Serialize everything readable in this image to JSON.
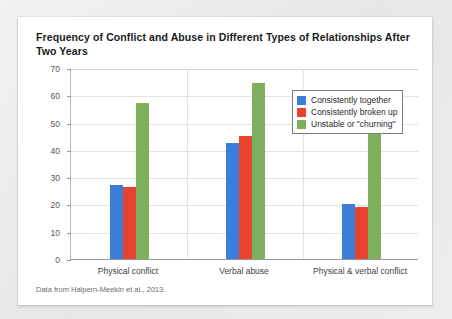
{
  "figure": {
    "title": "Frequency of Conflict and Abuse in Different Types of Relationships After Two Years",
    "caption": "Data from Halpern-Meekin et al., 2013."
  },
  "chart_data": {
    "type": "bar",
    "title": "Frequency of Conflict and Abuse in Different Types of Relationships After Two Years",
    "xlabel": "",
    "ylabel": "",
    "ylim": [
      0,
      70
    ],
    "yticks": [
      0,
      10,
      20,
      30,
      40,
      50,
      60,
      70
    ],
    "grid": true,
    "legend_position": "top-right",
    "categories": [
      "Physical conflict",
      "Verbal abuse",
      "Physical & verbal conflict"
    ],
    "series": [
      {
        "name": "Consistently together",
        "color": "#3b7dd8",
        "values": [
          27,
          42.5,
          20
        ]
      },
      {
        "name": "Consistently broken up",
        "color": "#e8432e",
        "values": [
          26.5,
          45,
          19
        ]
      },
      {
        "name": "Unstable or \"churning\"",
        "color": "#7cb05c",
        "values": [
          57,
          64.5,
          48.5
        ]
      }
    ]
  }
}
